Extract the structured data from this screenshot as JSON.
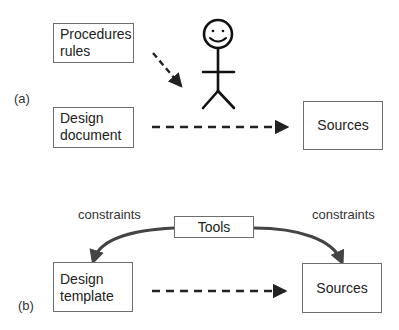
{
  "panel_a": {
    "label": "(a)",
    "procedures_box": {
      "line1": "Procedures",
      "line2": "rules"
    },
    "design_document_box": {
      "line1": "Design",
      "line2": "document"
    },
    "sources_box": {
      "text": "Sources"
    },
    "actor_icon": "stick-figure-smiley"
  },
  "panel_b": {
    "label": "(b)",
    "tools_box": {
      "text": "Tools"
    },
    "constraints_left": "constraints",
    "constraints_right": "constraints",
    "design_template_box": {
      "line1": "Design",
      "line2": "template"
    },
    "sources_box": {
      "text": "Sources"
    }
  },
  "colors": {
    "line": "#222222",
    "curve": "#444444",
    "border": "#6e6e6e"
  }
}
